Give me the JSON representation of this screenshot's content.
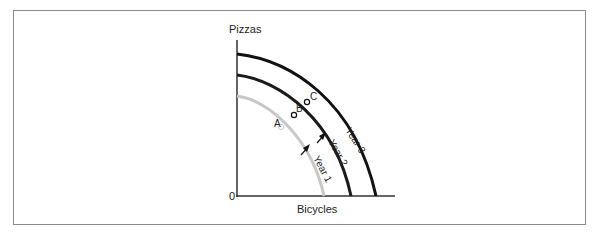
{
  "diagram": {
    "y_axis_label": "Pizzas",
    "x_axis_label": "Bicycles",
    "origin_label": "0",
    "curves": [
      {
        "label": "Year 1",
        "color": "#c8c8c8"
      },
      {
        "label": "Year 2",
        "color": "#1a1a1a"
      },
      {
        "label": "Year 3",
        "color": "#111111"
      }
    ],
    "points": [
      {
        "label": "A",
        "on": "Year 1"
      },
      {
        "label": "B",
        "on": "Year 2"
      },
      {
        "label": "C",
        "on": "Year 3"
      }
    ],
    "arrows": [
      "Year 1 to Year 2 shift",
      "Year 2 to Year 3 shift"
    ]
  }
}
